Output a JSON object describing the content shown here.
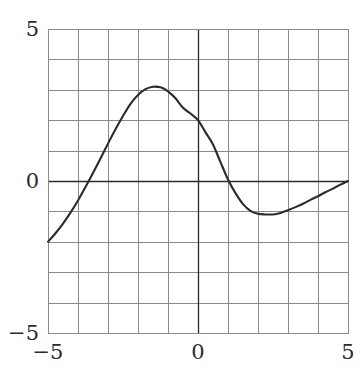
{
  "chart_data": {
    "type": "line",
    "title": "",
    "xlabel": "",
    "ylabel": "",
    "xlim": [
      -5,
      5
    ],
    "ylim": [
      -5,
      5
    ],
    "grid": true,
    "legend": null,
    "x_ticks": [
      -5,
      0,
      5
    ],
    "y_ticks": [
      -5,
      0,
      5
    ],
    "x_tick_labels": [
      "−5",
      "0",
      "5"
    ],
    "y_tick_labels": [
      "−5",
      "0",
      "5"
    ],
    "gridline_step": 1,
    "zero_axes": true,
    "series": [
      {
        "name": "curve",
        "color": "#2b2b2b",
        "x": [
          -5.0,
          -4.75,
          -4.5,
          -4.25,
          -4.0,
          -3.75,
          -3.5,
          -3.25,
          -3.0,
          -2.75,
          -2.5,
          -2.25,
          -2.0,
          -1.75,
          -1.5,
          -1.25,
          -1.0,
          -0.75,
          -0.5,
          -0.25,
          0.0,
          0.25,
          0.5,
          0.75,
          1.0,
          1.25,
          1.5,
          1.75,
          2.0,
          2.25,
          2.5,
          2.75,
          3.0,
          3.25,
          3.5,
          3.75,
          4.0,
          4.25,
          4.5,
          4.75,
          5.0
        ],
        "y": [
          -2.0,
          -1.72,
          -1.4,
          -1.04,
          -0.64,
          -0.2,
          0.26,
          0.74,
          1.23,
          1.7,
          2.14,
          2.54,
          2.83,
          3.02,
          3.1,
          3.08,
          2.95,
          2.72,
          2.41,
          2.22,
          2.0,
          1.6,
          1.2,
          0.62,
          0.05,
          -0.4,
          -0.76,
          -0.98,
          -1.08,
          -1.1,
          -1.1,
          -1.05,
          -0.96,
          -0.86,
          -0.75,
          -0.62,
          -0.5,
          -0.37,
          -0.25,
          -0.12,
          0.0
        ]
      }
    ],
    "annotations": {
      "left_endpoint": {
        "x": -5,
        "y": -2
      },
      "first_zero_crossing": {
        "x": -4.1,
        "y": 0
      },
      "maximum": {
        "x": -1.35,
        "y": 3.1
      },
      "value_at_origin": {
        "x": 0,
        "y": 2.0
      },
      "second_zero_crossing": {
        "x": 1.05,
        "y": 0
      },
      "minimum": {
        "x": 2.4,
        "y": -1.1
      },
      "right_endpoint": {
        "x": 5,
        "y": 0
      }
    }
  },
  "style": {
    "curve_color": "#2b2b2b",
    "gridline_color": "#8a8a8a",
    "axis_color": "#2b2b2b",
    "background_color": "#ffffff"
  },
  "labels": {
    "y_top": "5",
    "y_zero": "0",
    "y_bottom": "−5",
    "x_left": "−5",
    "x_zero": "0",
    "x_right": "5"
  }
}
